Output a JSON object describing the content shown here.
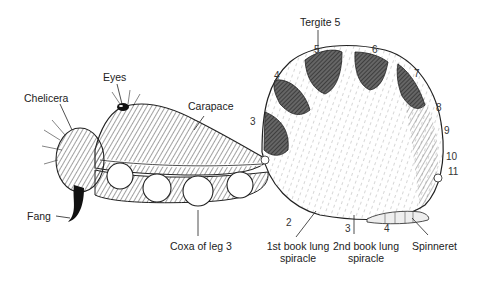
{
  "diagram": {
    "labels": {
      "tergite5": "Tergite 5",
      "eyes": "Eyes",
      "chelicera": "Chelicera",
      "carapace": "Carapace",
      "fang": "Fang",
      "coxa": "Coxa of leg 3",
      "lung1_line1": "1st book lung",
      "lung1_line2": "spiracle",
      "lung2_line1": "2nd book lung",
      "lung2_line2": "spiracle",
      "spinneret": "Spinneret"
    },
    "segment_numbers": {
      "s2": "2",
      "s3": "3",
      "s4": "4",
      "s5": "5",
      "s6": "6",
      "s7": "7",
      "s8": "8",
      "s9": "9",
      "s10": "10",
      "s11": "11",
      "v3": "3",
      "v4": "4"
    },
    "colors": {
      "ink": "#1a1a1a",
      "shade": "#555555",
      "paper": "#ffffff"
    }
  }
}
